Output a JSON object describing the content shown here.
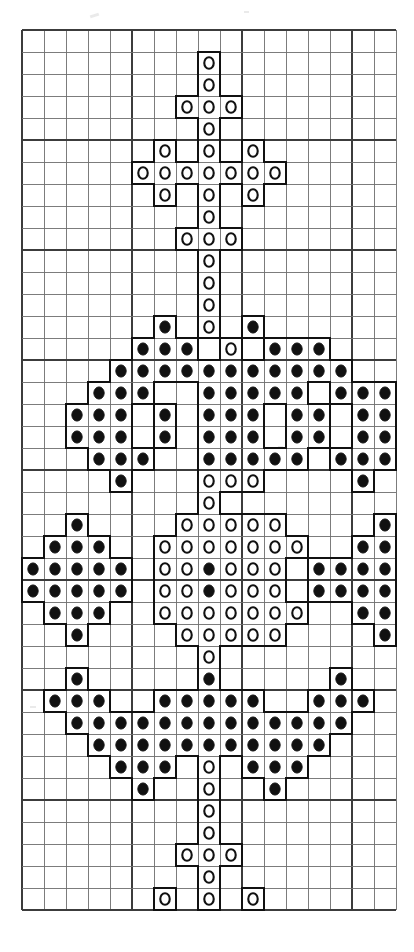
{
  "document": {
    "title": "Cross Stitch Pattern Chart",
    "type": "counted-cross-stitch-grid-chart",
    "media": "printed graph paper chart, black ink on white"
  },
  "grid": {
    "columns": 17,
    "rows": 40,
    "cell_size_px": 22,
    "origin_x_px": 22,
    "origin_y_px": 30,
    "line_color": "#6e6e6e",
    "major_line_color": "#3c3c3c",
    "major_every": 5,
    "background_color": "#ffffff"
  },
  "symbols": {
    "open": {
      "name": "open-circle-stitch",
      "glyph": "O",
      "fill": "#ffffff",
      "stroke": "#111111",
      "description": "light / white thread stitch"
    },
    "filled": {
      "name": "filled-circle-stitch",
      "glyph": "●",
      "fill": "#111111",
      "stroke": "#111111",
      "description": "dark / black thread stitch"
    },
    "cell_outline_color": "#111111",
    "cell_outline_width_px": 2
  },
  "chart_data": {
    "type": "heatmap",
    "xlabel": "",
    "ylabel": "",
    "categories": [
      "1",
      "2",
      "3",
      "4",
      "5",
      "6",
      "7",
      "8",
      "9",
      "10",
      "11",
      "12",
      "13",
      "14",
      "15",
      "16",
      "17"
    ],
    "legend": [
      "open = light thread",
      "filled = dark thread"
    ],
    "legend_position": "none",
    "grid": true,
    "note": "Each string is one chart row of 17 columns. '.' = empty cell, 'o' = open circle stitch, 'x' = filled circle stitch.",
    "rows": [
      ".................",
      "........o........",
      "........o........",
      ".......ooo.......",
      "........o........",
      "......o.o.o......",
      ".....ooooooo.....",
      "......o.o.o......",
      "........o........",
      ".......ooo.......",
      "........o........",
      "........o........",
      "........o........",
      "......x.o.x......",
      ".....xxx.o.xxx...",
      "....xxxxxxxxxxx..",
      "...xxx..xxxxx.xxx",
      "..xxx.x.xxx.xx.xx",
      "..xxx.x.xxx.xx.xx",
      "...xxx..xxxxx.xxx",
      "....x...ooo....x.",
      "........o........",
      "..x....ooooo....x",
      ".xxx..ooooooo..xxx",
      "xxxxx.ooxooo.xxxxx",
      "xxxxx.ooxooo.xxxxx",
      ".xxx..ooooooo..xxx",
      "..x....ooooo....x",
      "........o........",
      "..x.....x.....x..",
      ".xxx..xxxxx..xxx.",
      "..xxxxxxxxxxxxx..",
      "...xxxxxxxxxxx...",
      "....xxx.o.xxx....",
      ".....x..o..x.....",
      "........o........",
      "........o........",
      ".......ooo.......",
      "........o........",
      "......o.o.o......",
      ".....ooooooo.....",
      "......o.o.o......",
      "........o........",
      ".......ooo.......",
      "........o........",
      "........o........",
      "................."
    ],
    "motif_description": "Symmetrical anchor / cross motif: an upper cross of open-circle stitches, a central winged body of filled-circle stitches enclosing an open-circle diamond, and a lower cross of open-circle stitches."
  },
  "stitches": {
    "upper_cross": [
      {
        "r": 1,
        "c": 8,
        "s": "open"
      },
      {
        "r": 2,
        "c": 8,
        "s": "open"
      },
      {
        "r": 3,
        "c": 7,
        "s": "open"
      },
      {
        "r": 3,
        "c": 8,
        "s": "open"
      },
      {
        "r": 3,
        "c": 9,
        "s": "open"
      },
      {
        "r": 4,
        "c": 8,
        "s": "open"
      },
      {
        "r": 5,
        "c": 6,
        "s": "open"
      },
      {
        "r": 5,
        "c": 8,
        "s": "open"
      },
      {
        "r": 5,
        "c": 10,
        "s": "open"
      },
      {
        "r": 6,
        "c": 5,
        "s": "open"
      },
      {
        "r": 6,
        "c": 6,
        "s": "open"
      },
      {
        "r": 6,
        "c": 7,
        "s": "open"
      },
      {
        "r": 6,
        "c": 8,
        "s": "open"
      },
      {
        "r": 6,
        "c": 9,
        "s": "open"
      },
      {
        "r": 6,
        "c": 10,
        "s": "open"
      },
      {
        "r": 6,
        "c": 11,
        "s": "open"
      },
      {
        "r": 7,
        "c": 6,
        "s": "open"
      },
      {
        "r": 7,
        "c": 8,
        "s": "open"
      },
      {
        "r": 7,
        "c": 10,
        "s": "open"
      },
      {
        "r": 8,
        "c": 8,
        "s": "open"
      },
      {
        "r": 9,
        "c": 7,
        "s": "open"
      },
      {
        "r": 9,
        "c": 8,
        "s": "open"
      },
      {
        "r": 9,
        "c": 9,
        "s": "open"
      },
      {
        "r": 10,
        "c": 8,
        "s": "open"
      },
      {
        "r": 11,
        "c": 8,
        "s": "open"
      },
      {
        "r": 12,
        "c": 8,
        "s": "open"
      }
    ],
    "lower_cross": [
      {
        "r": 28,
        "c": 8,
        "s": "open"
      },
      {
        "r": 29,
        "c": 8,
        "s": "open"
      },
      {
        "r": 30,
        "c": 8,
        "s": "open"
      },
      {
        "r": 31,
        "c": 7,
        "s": "open"
      },
      {
        "r": 31,
        "c": 8,
        "s": "open"
      },
      {
        "r": 31,
        "c": 9,
        "s": "open"
      },
      {
        "r": 32,
        "c": 8,
        "s": "open"
      },
      {
        "r": 33,
        "c": 6,
        "s": "open"
      },
      {
        "r": 33,
        "c": 8,
        "s": "open"
      },
      {
        "r": 33,
        "c": 10,
        "s": "open"
      },
      {
        "r": 34,
        "c": 5,
        "s": "open"
      },
      {
        "r": 34,
        "c": 6,
        "s": "open"
      },
      {
        "r": 34,
        "c": 7,
        "s": "open"
      },
      {
        "r": 34,
        "c": 8,
        "s": "open"
      },
      {
        "r": 34,
        "c": 9,
        "s": "open"
      },
      {
        "r": 34,
        "c": 10,
        "s": "open"
      },
      {
        "r": 34,
        "c": 11,
        "s": "open"
      },
      {
        "r": 35,
        "c": 6,
        "s": "open"
      },
      {
        "r": 35,
        "c": 8,
        "s": "open"
      },
      {
        "r": 35,
        "c": 10,
        "s": "open"
      },
      {
        "r": 36,
        "c": 8,
        "s": "open"
      },
      {
        "r": 37,
        "c": 7,
        "s": "open"
      },
      {
        "r": 37,
        "c": 8,
        "s": "open"
      },
      {
        "r": 37,
        "c": 9,
        "s": "open"
      },
      {
        "r": 38,
        "c": 8,
        "s": "open"
      },
      {
        "r": 39,
        "c": 8,
        "s": "open"
      }
    ]
  },
  "colors": {
    "ink": "#111111",
    "grid_line": "#6e6e6e",
    "grid_line_major": "#3b3b3b",
    "paper": "#ffffff"
  }
}
